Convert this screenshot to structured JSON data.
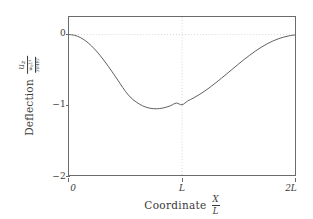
{
  "chart_data": {
    "type": "line",
    "title": "",
    "subtitle": "",
    "xlabel": "Coordinate X/L",
    "ylabel": "Deflection u_z / (w_0 L^4 / 384 EI)",
    "xlabel_parts": {
      "text": "Coordinate",
      "frac_num": "X",
      "frac_den": "L"
    },
    "ylabel_parts": {
      "text": "Deflection",
      "num": "u",
      "num_sub": "z",
      "den_num": "w",
      "den_num_sub": "0",
      "den_num_var": "L",
      "den_num_sup": "4",
      "den_den": "384EI"
    },
    "xlim": [
      0,
      2
    ],
    "ylim": [
      -2,
      0.25
    ],
    "xticks": [
      0,
      1,
      2
    ],
    "xtick_labels": [
      "0",
      "L",
      "2L"
    ],
    "yticks": [
      0,
      -1,
      -2
    ],
    "ytick_labels": [
      "0",
      "-1",
      "-2"
    ],
    "grid": "dotted",
    "gridlines_y": [
      0
    ],
    "gridlines_x": [
      1
    ],
    "legend": "none",
    "line_color": "#4a4a4a",
    "frame_color": "#6b6b6b",
    "grid_color": "#c8c8c8",
    "series": [
      {
        "name": "deflection",
        "x": [
          0.0,
          0.05,
          0.1,
          0.15,
          0.2,
          0.25,
          0.3,
          0.35,
          0.4,
          0.45,
          0.5,
          0.55,
          0.6,
          0.65,
          0.7,
          0.75,
          0.8,
          0.85,
          0.9,
          0.95,
          1.0,
          1.05,
          1.1,
          1.15,
          1.2,
          1.25,
          1.3,
          1.35,
          1.4,
          1.45,
          1.5,
          1.55,
          1.6,
          1.65,
          1.7,
          1.75,
          1.8,
          1.85,
          1.9,
          1.95,
          2.0
        ],
        "y": [
          0.0,
          -0.011,
          -0.042,
          -0.094,
          -0.163,
          -0.249,
          -0.348,
          -0.457,
          -0.573,
          -0.692,
          -0.81,
          -0.903,
          -0.966,
          -1.014,
          -1.043,
          -1.056,
          -1.054,
          -1.039,
          -1.012,
          -0.976,
          -1.0,
          -0.946,
          -0.905,
          -0.858,
          -0.806,
          -0.748,
          -0.686,
          -0.621,
          -0.554,
          -0.487,
          -0.42,
          -0.355,
          -0.293,
          -0.235,
          -0.182,
          -0.135,
          -0.095,
          -0.062,
          -0.036,
          -0.017,
          -0.006
        ]
      }
    ],
    "minimum": {
      "x": 0.76,
      "y": -1.056
    },
    "endpoints": [
      {
        "x": 0,
        "y": 0
      },
      {
        "x": 2,
        "y": -0.006
      }
    ]
  }
}
